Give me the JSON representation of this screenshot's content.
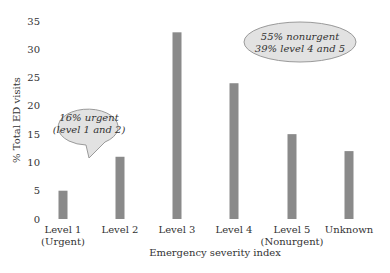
{
  "chart_data": {
    "type": "bar",
    "title": "",
    "xlabel": "Emergency severity index",
    "ylabel": "% Total ED visits",
    "ylim": [
      0,
      35
    ],
    "yticks": [
      0,
      5,
      10,
      15,
      20,
      25,
      30,
      35
    ],
    "grid": false,
    "bar_color": "#8a8a8a",
    "categories": [
      [
        "Level 1",
        "(Urgent)"
      ],
      [
        "Level 2"
      ],
      [
        "Level 3"
      ],
      [
        "Level 4"
      ],
      [
        "Level 5",
        "(Nonurgent)"
      ],
      [
        "Unknown"
      ]
    ],
    "values": [
      5,
      11,
      33,
      24,
      15,
      12
    ],
    "annotations": [
      {
        "lines": [
          "16% urgent",
          "(level 1 and 2)"
        ],
        "shape": "speech-bubble",
        "near": "Level 1-2"
      },
      {
        "lines": [
          "55% nonurgent",
          "39% level 4 and 5"
        ],
        "shape": "ellipse",
        "near": "top-right"
      }
    ],
    "annotation_fill": "#e2e2e2",
    "annotation_stroke": "#9a9a9a"
  }
}
